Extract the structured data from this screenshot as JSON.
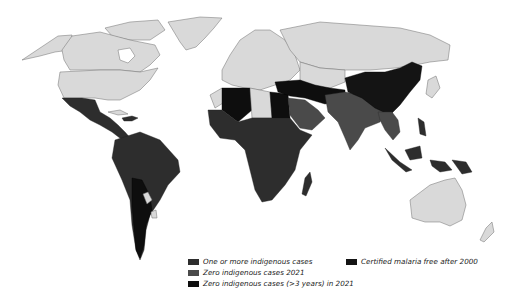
{
  "map": {
    "title": "",
    "colors": {
      "no_malaria": "#d9d9d9",
      "one_or_more_cases": "#2d2d2d",
      "zero_cases_2021": "#4a4a4a",
      "zero_cases_3yrs_2021": "#0e0e0e",
      "certified_free_after_2000": "#141414"
    }
  },
  "legend": {
    "items": [
      {
        "label": "One or more indigenous cases",
        "color": "#2d2d2d"
      },
      {
        "label": "Zero indigenous cases 2021",
        "color": "#4a4a4a"
      },
      {
        "label": "Zero indigenous cases (>3 years) in 2021",
        "color": "#0e0e0e"
      },
      {
        "label": "Certified malaria free after 2000",
        "color": "#141414"
      }
    ]
  }
}
